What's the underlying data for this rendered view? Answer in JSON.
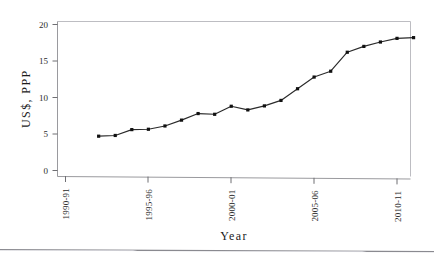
{
  "page": {
    "top_text_fragment": "",
    "has_bottom_rule": true
  },
  "chart_data": {
    "type": "line",
    "title": "",
    "xlabel": "Year",
    "ylabel": "US$, PPP",
    "xlim_labels": [
      "1990-91",
      "1995-96",
      "2000-01",
      "2005-06",
      "2010-11"
    ],
    "ylim": [
      0,
      20
    ],
    "yticks": [
      0,
      5,
      10,
      15,
      20
    ],
    "ytick_labels": [
      "0",
      "5",
      "10",
      "15",
      "20"
    ],
    "xticks": [
      "1990-91",
      "1995-96",
      "2000-01",
      "2005-06",
      "2010-11"
    ],
    "grid": false,
    "legend": "none",
    "marker": "filled-square",
    "line_color": "#2a2a2a",
    "marker_color": "#111111",
    "x": [
      "1992-93",
      "1993-94",
      "1994-95",
      "1995-96",
      "1996-97",
      "1997-98",
      "1998-99",
      "1999-00",
      "2000-01",
      "2001-02",
      "2002-03",
      "2003-04",
      "2004-05",
      "2005-06",
      "2006-07",
      "2007-08",
      "2008-09",
      "2009-10",
      "2010-11",
      "2011-12"
    ],
    "values": [
      4.7,
      4.8,
      5.6,
      5.65,
      6.1,
      6.9,
      7.8,
      7.7,
      8.8,
      8.3,
      8.85,
      9.6,
      11.2,
      12.8,
      13.6,
      16.2,
      17.0,
      17.6,
      18.1,
      18.2
    ],
    "series": [
      {
        "name": "US$, PPP",
        "values": [
          4.7,
          4.8,
          5.6,
          5.65,
          6.1,
          6.9,
          7.8,
          7.7,
          8.8,
          8.3,
          8.85,
          9.6,
          11.2,
          12.8,
          13.6,
          16.2,
          17.0,
          17.6,
          18.1,
          18.2
        ]
      }
    ]
  }
}
